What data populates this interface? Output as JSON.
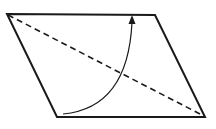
{
  "diagram": {
    "type": "geometry",
    "shape": {
      "name": "parallelogram",
      "vertices": {
        "top_left": [
          7,
          14
        ],
        "top_right": [
          155,
          15
        ],
        "bottom_right": [
          205,
          117
        ],
        "bottom_left": [
          57,
          117
        ]
      },
      "stroke": "#1a1a1a",
      "stroke_width": 2
    },
    "diagonal": {
      "from": "top_left",
      "to": "bottom_right",
      "style": "dashed",
      "stroke": "#1a1a1a"
    },
    "arrow": {
      "style": "curved",
      "start": [
        63,
        114
      ],
      "end": [
        132,
        16
      ],
      "direction": "counterclockwise",
      "stroke": "#1a1a1a"
    },
    "colors": {
      "background": "#ffffff",
      "ink": "#1a1a1a"
    }
  }
}
